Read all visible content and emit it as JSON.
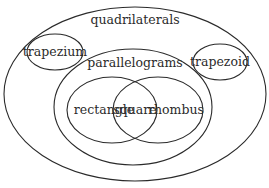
{
  "diagram": {
    "type": "venn",
    "sets": [
      {
        "id": "quadrilaterals",
        "label": "quadrilaterals",
        "cx": 135,
        "cy": 94,
        "rx": 131,
        "ry": 87,
        "label_x": 135,
        "label_y": 24
      },
      {
        "id": "trapezium",
        "label": "trapezium",
        "cx": 55,
        "cy": 52,
        "rx": 28,
        "ry": 18,
        "label_x": 55,
        "label_y": 56
      },
      {
        "id": "trapezoid",
        "label": "trapezoid",
        "cx": 220,
        "cy": 62,
        "rx": 27,
        "ry": 18,
        "label_x": 220,
        "label_y": 66
      },
      {
        "id": "parallelograms",
        "label": "parallelograms",
        "cx": 133,
        "cy": 107,
        "rx": 79,
        "ry": 58,
        "label_x": 135,
        "label_y": 67
      },
      {
        "id": "rectangle",
        "label": "rectangle",
        "cx": 112,
        "cy": 110,
        "rx": 45,
        "ry": 33,
        "label_x": 104,
        "label_y": 114
      },
      {
        "id": "rhombus",
        "label": "rhombus",
        "cx": 158,
        "cy": 110,
        "rx": 45,
        "ry": 33,
        "label_x": 176,
        "label_y": 114
      }
    ],
    "intersection": {
      "id": "square",
      "label": "square",
      "label_x": 135,
      "label_y": 114
    }
  },
  "colors": {
    "stroke": "#2a2a2a",
    "text": "#2b2b2b",
    "background": "#ffffff"
  }
}
